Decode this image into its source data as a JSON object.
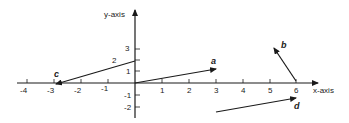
{
  "diagram": {
    "x_axis_label": "x-axis",
    "y_axis_label": "y-axis",
    "x_ticks": [
      "-4",
      "-3",
      "-2",
      "-1",
      "1",
      "2",
      "3",
      "4",
      "5",
      "6"
    ],
    "y_ticks": [
      "3",
      "2",
      "1",
      "-1",
      "-2"
    ],
    "vectors": [
      {
        "name": "a",
        "from": [
          0,
          0
        ],
        "to": [
          3,
          1.2
        ]
      },
      {
        "name": "b",
        "from": [
          6,
          0
        ],
        "to": [
          4.8,
          2.8
        ]
      },
      {
        "name": "c",
        "from": [
          0,
          1.7
        ],
        "to": [
          -3,
          0
        ]
      },
      {
        "name": "d",
        "from": [
          3,
          -3
        ],
        "to": [
          6,
          -1.3
        ]
      }
    ],
    "annotation_2": "2",
    "stroke_color": "#1a1a1a"
  }
}
